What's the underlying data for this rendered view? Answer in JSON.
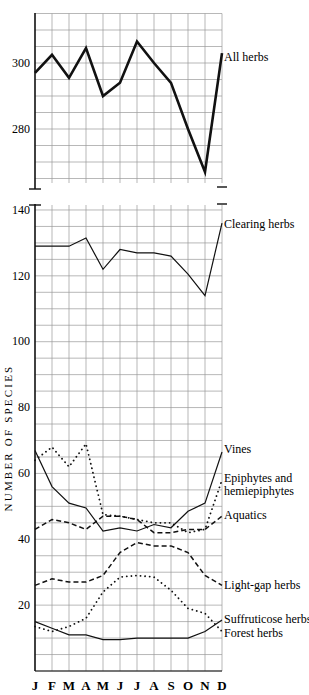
{
  "chart_data": {
    "type": "line",
    "ylabel": "NUMBER OF SPECIES",
    "xlabel": "",
    "categories": [
      "J",
      "F",
      "M",
      "A",
      "M",
      "J",
      "J",
      "A",
      "S",
      "O",
      "N",
      "D"
    ],
    "grid": true,
    "panels": [
      {
        "name": "top",
        "ylim": [
          265,
          315
        ],
        "yticks": [
          280,
          300
        ],
        "broken_axis_bottom": true,
        "series": [
          {
            "name": "All herbs",
            "style": "solid-thick",
            "values": [
              297,
              302.5,
              295.5,
              304.5,
              290,
              294,
              306.5,
              300,
              294,
              280,
              267,
              303
            ]
          }
        ]
      },
      {
        "name": "bottom",
        "ylim": [
          0,
          140
        ],
        "yticks": [
          20,
          40,
          60,
          80,
          100,
          120,
          140
        ],
        "broken_axis_top": true,
        "series": [
          {
            "name": "Clearing herbs",
            "style": "solid",
            "values": [
              129,
              129,
              129,
              131.5,
              122,
              128,
              127,
              127,
              126,
              120.5,
              114,
              136
            ]
          },
          {
            "name": "Vines",
            "style": "solid",
            "values": [
              67,
              56,
              51,
              49.5,
              42.5,
              43.5,
              42.5,
              44.5,
              43.5,
              48.5,
              51,
              66.5
            ]
          },
          {
            "name": "Epiphytes and hemiepiphytes",
            "style": "dotted",
            "values": [
              64,
              68,
              62,
              69,
              47.5,
              47,
              46,
              45,
              45,
              42,
              43,
              58
            ]
          },
          {
            "name": "Aquatics",
            "style": "dashed",
            "values": [
              43,
              46,
              45,
              43,
              47,
              47,
              46,
              42,
              42,
              43,
              43,
              47
            ]
          },
          {
            "name": "Light-gap herbs",
            "style": "dashed",
            "values": [
              26,
              28,
              27,
              27,
              29,
              36,
              39,
              38,
              38,
              36,
              29,
              26
            ]
          },
          {
            "name": "Suffruticose herbs",
            "style": "dotted",
            "values": [
              13.5,
              12,
              13.5,
              16,
              24,
              28.5,
              29,
              28.5,
              24.5,
              19,
              17.5,
              12
            ]
          },
          {
            "name": "Forest herbs",
            "style": "solid",
            "values": [
              15,
              13,
              11,
              11,
              9.5,
              9.5,
              10,
              10,
              10,
              10,
              12,
              15.5
            ]
          }
        ]
      }
    ]
  },
  "labels": {
    "all_herbs": "All herbs",
    "clearing_herbs": "Clearing herbs",
    "vines": "Vines",
    "epiphytes_line1": "Epiphytes and",
    "epiphytes_line2": "hemiepiphytes",
    "aquatics": "Aquatics",
    "light_gap": "Light-gap herbs",
    "suffruticose": "Suffruticose herbs",
    "forest": "Forest herbs",
    "ylabel": "NUMBER OF SPECIES"
  },
  "ticks": {
    "top": [
      "300",
      "280"
    ],
    "bottom": [
      "140",
      "120",
      "100",
      "80",
      "60",
      "40",
      "20"
    ]
  },
  "months": [
    "J",
    "F",
    "M",
    "A",
    "M",
    "J",
    "J",
    "A",
    "S",
    "O",
    "N",
    "D"
  ]
}
